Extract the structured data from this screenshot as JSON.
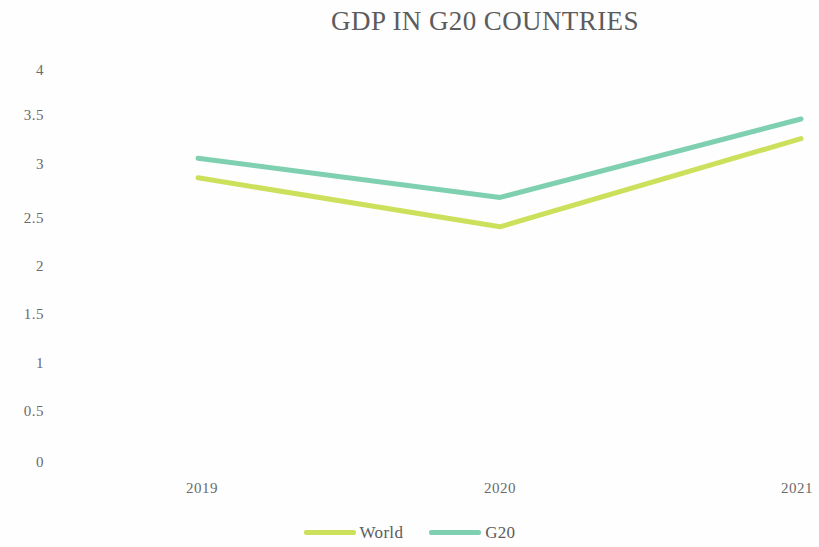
{
  "chart_data": {
    "type": "line",
    "title": "GDP IN G20 COUNTRIES",
    "xlabel": "",
    "ylabel": "",
    "categories": [
      "2019",
      "2020",
      "2021"
    ],
    "series": [
      {
        "name": "World",
        "values": [
          2.9,
          2.4,
          3.3
        ],
        "color": "#cde05c"
      },
      {
        "name": "G20",
        "values": [
          3.1,
          2.7,
          3.5
        ],
        "color": "#7ed0b0"
      }
    ],
    "ylim": [
      0,
      4
    ],
    "y_ticks": [
      "4",
      "3.5",
      "3",
      "2.5",
      "2",
      "1.5",
      "1",
      "0.5",
      "0"
    ],
    "y_tick_values": [
      4,
      3.5,
      3,
      2.5,
      2,
      1.5,
      1,
      0.5,
      0
    ],
    "grid": false,
    "legend_position": "bottom-center",
    "background_color": "#fefefe",
    "text_color": "#6a6a6a"
  },
  "legend": {
    "entries": [
      {
        "label": "World",
        "color": "#cde05c"
      },
      {
        "label": "G20",
        "color": "#7ed0b0"
      }
    ]
  }
}
